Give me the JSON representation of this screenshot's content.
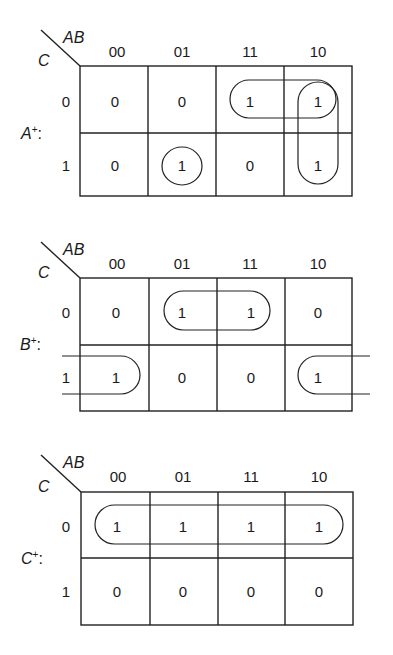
{
  "kmaps": [
    {
      "name": "A+",
      "label": "A",
      "sup": "+",
      "colon": ":",
      "row_var": "C",
      "col_var": "AB",
      "col_headers": [
        "00",
        "01",
        "11",
        "10"
      ],
      "row_headers": [
        "0",
        "1"
      ],
      "cells": [
        [
          "0",
          "0",
          "1",
          "1"
        ],
        [
          "0",
          "1",
          "0",
          "1"
        ]
      ],
      "groups": [
        "C=0, AB in {11,10}",
        "AB=10, C in {0,1}",
        "C=1, AB=01"
      ]
    },
    {
      "name": "B+",
      "label": "B",
      "sup": "+",
      "colon": ":",
      "row_var": "C",
      "col_var": "AB",
      "col_headers": [
        "00",
        "01",
        "11",
        "10"
      ],
      "row_headers": [
        "0",
        "1"
      ],
      "cells": [
        [
          "0",
          "1",
          "1",
          "0"
        ],
        [
          "1",
          "0",
          "0",
          "1"
        ]
      ],
      "groups": [
        "C=0, AB in {01,11}",
        "C=1, AB in {00,10} (wrap-around)"
      ]
    },
    {
      "name": "C+",
      "label": "C",
      "sup": "+",
      "colon": ":",
      "row_var": "C",
      "col_var": "AB",
      "col_headers": [
        "00",
        "01",
        "11",
        "10"
      ],
      "row_headers": [
        "0",
        "1"
      ],
      "cells": [
        [
          "1",
          "1",
          "1",
          "1"
        ],
        [
          "0",
          "0",
          "0",
          "0"
        ]
      ],
      "groups": [
        "C=0, all AB"
      ]
    }
  ]
}
